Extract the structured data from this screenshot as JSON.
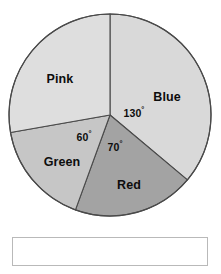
{
  "chart_data": {
    "type": "pie",
    "title": "",
    "subtitle": "",
    "xlabel": "",
    "ylabel": "",
    "legend_position": "none",
    "grid": false,
    "start_angle_deg": 0,
    "direction": "clockwise",
    "units": "degrees",
    "total_degrees": 360,
    "categories": [
      "Blue",
      "Red",
      "Green",
      "Pink"
    ],
    "values": [
      130,
      70,
      60,
      100
    ],
    "labeled_values": [
      130,
      70,
      60,
      null
    ],
    "slices": [
      {
        "label": "Blue",
        "angle_deg": 130,
        "angle_label": "130",
        "angle_label_shown": true,
        "start_deg": 0,
        "end_deg": 130,
        "fill": "#d9d9d9"
      },
      {
        "label": "Red",
        "angle_deg": 70,
        "angle_label": "70",
        "angle_label_shown": true,
        "start_deg": 130,
        "end_deg": 200,
        "fill": "#a3a3a3"
      },
      {
        "label": "Green",
        "angle_deg": 60,
        "angle_label": "60",
        "angle_label_shown": true,
        "start_deg": 200,
        "end_deg": 260,
        "fill": "#c6c6c6"
      },
      {
        "label": "Pink",
        "angle_deg": 100,
        "angle_label": "",
        "angle_label_shown": false,
        "start_deg": 260,
        "end_deg": 360,
        "fill": "#dedede"
      }
    ],
    "degree_symbol": "°",
    "outline_color": "#4a4a4a"
  },
  "figure": {
    "labels": {
      "blue": "Blue",
      "pink": "Pink",
      "green": "Green",
      "red": "Red"
    },
    "angle_labels": {
      "blue": "130",
      "green": "60",
      "red": "70"
    },
    "degree_symbol": "°"
  },
  "answer_box": {
    "value": "",
    "placeholder": ""
  }
}
